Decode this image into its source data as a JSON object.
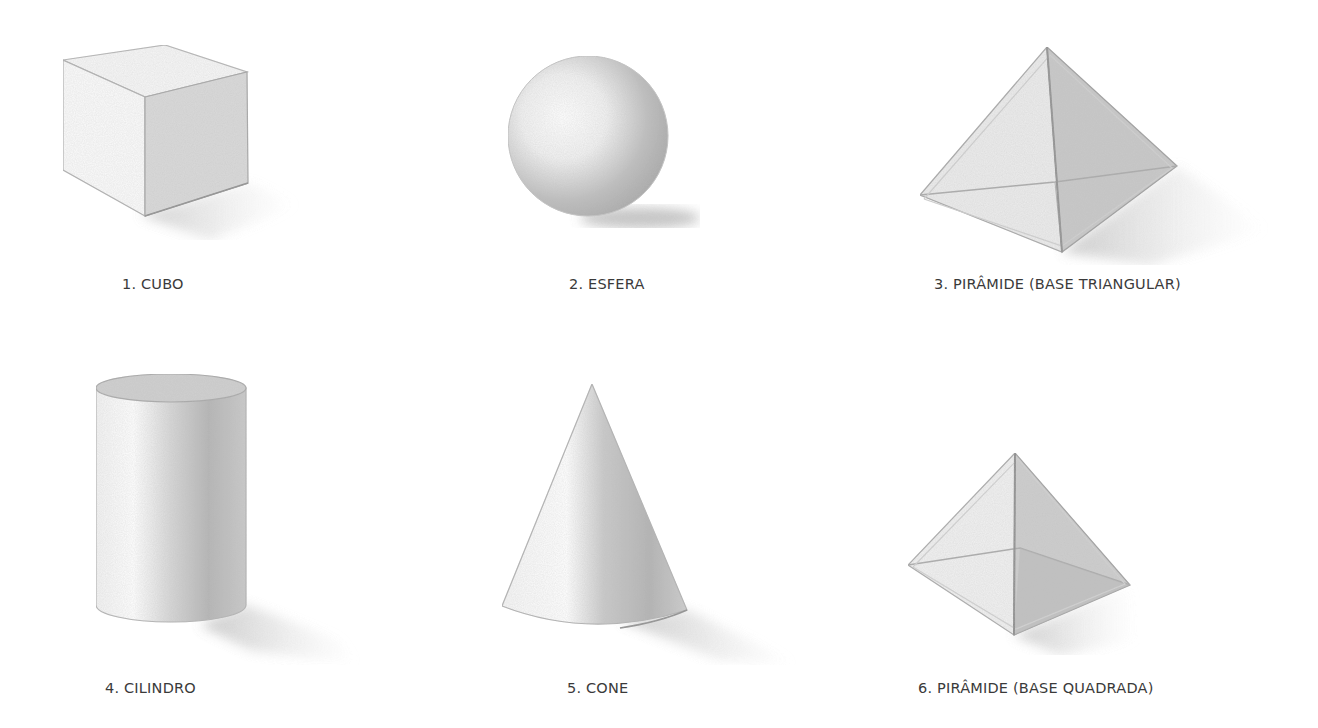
{
  "figures": [
    {
      "number": "1.",
      "name": "CUBO",
      "label": "1. CUBO"
    },
    {
      "number": "2.",
      "name": "ESFERA",
      "label": "2. ESFERA"
    },
    {
      "number": "3.",
      "name": "PIRÂMIDE (BASE TRIANGULAR)",
      "label": "3. PIRÂMIDE (BASE TRIANGULAR)"
    },
    {
      "number": "4.",
      "name": "CILINDRO",
      "label": "4. CILINDRO"
    },
    {
      "number": "5.",
      "name": "CONE",
      "label": "5. CONE"
    },
    {
      "number": "6.",
      "name": "PIRÂMIDE (BASE QUADRADA)",
      "label": "6. PIRÂMIDE (BASE QUADRADA)"
    }
  ],
  "colors": {
    "background": "#ffffff",
    "label_text": "#3a3a3a",
    "pencil_line": "#9a9a9a",
    "shade_dark": "#a8a8a8",
    "shade_light": "#f4f4f4"
  }
}
